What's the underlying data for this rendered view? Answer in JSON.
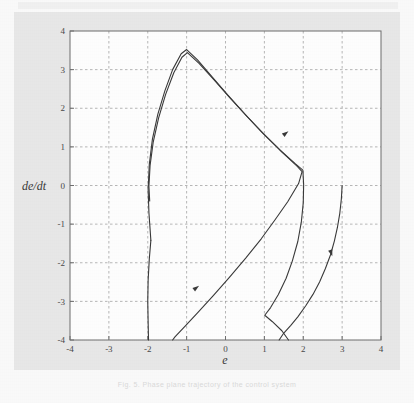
{
  "figure": {
    "background_color": "#e9e9e9",
    "plot_background_color": "#ffffff",
    "grid_color": "#9a9a9a",
    "axis_color": "#6e6e6e",
    "curve_color": "#3a3a3a",
    "caption": "Fig. 5.  Phase plane trajectory of the control system"
  },
  "chart_data": {
    "type": "line",
    "title": "",
    "subtitle": "",
    "xlabel": "e",
    "ylabel": "de/dt",
    "xlim": [
      -4,
      4
    ],
    "ylim": [
      -4,
      4
    ],
    "xticks": [
      -4,
      -3,
      -2,
      -1,
      0,
      1,
      2,
      3,
      4
    ],
    "yticks": [
      -4,
      -3,
      -2,
      -1,
      0,
      1,
      2,
      3,
      4
    ],
    "xticklabels": [
      "-4",
      "-3",
      "-2",
      "-1",
      "0",
      "1",
      "2",
      "3",
      "4"
    ],
    "yticklabels": [
      "-4",
      "-3",
      "-2",
      "-1",
      "0",
      "1",
      "2",
      "3",
      "4"
    ],
    "grid": true,
    "grid_style": "dashed",
    "legend": false,
    "legend_position": "none",
    "annotations": [
      {
        "name": "direction-arrow-upper-right",
        "x": 1.55,
        "y": 1.35,
        "angle_deg": -38
      },
      {
        "name": "direction-arrow-lower-left",
        "x": -0.75,
        "y": -2.65,
        "angle_deg": -36
      },
      {
        "name": "direction-arrow-right-branch",
        "x": 2.72,
        "y": -1.75,
        "angle_deg": 72
      }
    ],
    "series": [
      {
        "name": "outer-trajectory",
        "points": [
          [
            -1.92,
            -1.42
          ],
          [
            -1.97,
            -0.7
          ],
          [
            -1.99,
            -0.1
          ],
          [
            -1.96,
            0.55
          ],
          [
            -1.88,
            1.2
          ],
          [
            -1.74,
            1.85
          ],
          [
            -1.56,
            2.45
          ],
          [
            -1.36,
            3.0
          ],
          [
            -1.14,
            3.41
          ],
          [
            -1.0,
            3.52
          ],
          [
            -0.72,
            3.25
          ],
          [
            -0.35,
            2.82
          ],
          [
            0.05,
            2.35
          ],
          [
            0.5,
            1.85
          ],
          [
            0.95,
            1.36
          ],
          [
            1.4,
            0.92
          ],
          [
            1.8,
            0.56
          ],
          [
            1.99,
            0.4
          ],
          [
            2.01,
            0.02
          ],
          [
            2.0,
            -0.45
          ],
          [
            1.95,
            -0.95
          ],
          [
            1.86,
            -1.45
          ],
          [
            1.72,
            -1.95
          ],
          [
            1.56,
            -2.4
          ],
          [
            1.36,
            -2.82
          ],
          [
            1.16,
            -3.16
          ],
          [
            1.01,
            -3.36
          ],
          [
            1.2,
            -3.52
          ],
          [
            1.45,
            -3.76
          ],
          [
            1.62,
            -4.0
          ]
        ]
      },
      {
        "name": "inner-trajectory",
        "points": [
          [
            -1.95,
            -0.4
          ],
          [
            -1.97,
            -0.02
          ],
          [
            -1.94,
            0.52
          ],
          [
            -1.86,
            1.12
          ],
          [
            -1.72,
            1.75
          ],
          [
            -1.54,
            2.36
          ],
          [
            -1.33,
            2.92
          ],
          [
            -1.12,
            3.32
          ],
          [
            -0.98,
            3.44
          ],
          [
            -0.68,
            3.16
          ],
          [
            -0.3,
            2.74
          ],
          [
            0.12,
            2.26
          ],
          [
            0.56,
            1.78
          ],
          [
            1.02,
            1.3
          ],
          [
            1.46,
            0.86
          ],
          [
            1.84,
            0.5
          ],
          [
            1.97,
            0.36
          ],
          [
            1.88,
            0.05
          ],
          [
            1.6,
            -0.42
          ],
          [
            1.28,
            -0.88
          ],
          [
            0.92,
            -1.38
          ],
          [
            0.52,
            -1.88
          ],
          [
            0.1,
            -2.38
          ],
          [
            -0.32,
            -2.86
          ],
          [
            -0.72,
            -3.3
          ],
          [
            -1.02,
            -3.62
          ],
          [
            -1.3,
            -3.92
          ],
          [
            -1.36,
            -4.0
          ]
        ]
      },
      {
        "name": "entry-trajectory",
        "points": [
          [
            3.0,
            0.0
          ],
          [
            2.98,
            -0.35
          ],
          [
            2.94,
            -0.72
          ],
          [
            2.88,
            -1.08
          ],
          [
            2.8,
            -1.44
          ],
          [
            2.7,
            -1.8
          ],
          [
            2.57,
            -2.15
          ],
          [
            2.42,
            -2.5
          ],
          [
            2.25,
            -2.82
          ],
          [
            2.06,
            -3.12
          ],
          [
            1.86,
            -3.4
          ],
          [
            1.68,
            -3.62
          ],
          [
            1.5,
            -3.82
          ],
          [
            1.38,
            -4.0
          ]
        ]
      },
      {
        "name": "left-tail",
        "points": [
          [
            -1.92,
            -1.42
          ],
          [
            -1.96,
            -1.9
          ],
          [
            -1.99,
            -2.45
          ],
          [
            -2.0,
            -3.0
          ],
          [
            -1.99,
            -3.55
          ],
          [
            -1.98,
            -4.0
          ]
        ]
      }
    ]
  }
}
